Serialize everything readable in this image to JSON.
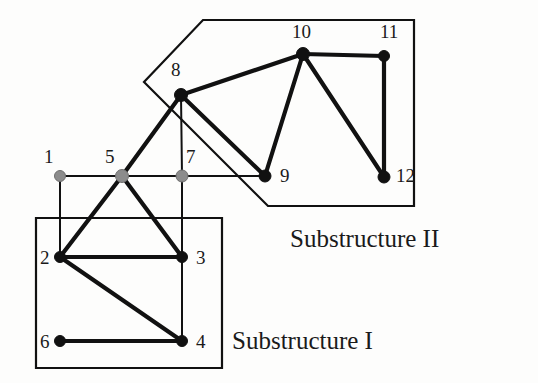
{
  "figure": {
    "background_color": "#fdfdfc",
    "ink_color": "#111111",
    "gray_node_color": "#8c8c8c",
    "black_node_color": "#111111"
  },
  "chart_data": {
    "type": "diagram",
    "subtype": "node-link-graph",
    "coordinate_space": {
      "width": 538,
      "height": 383,
      "origin": "top-left"
    },
    "nodes": [
      {
        "id": "1",
        "label": "1",
        "x": 60,
        "y": 176,
        "fill": "gray",
        "radius": 5.5,
        "label_x": 44,
        "label_y": 147
      },
      {
        "id": "2",
        "label": "2",
        "x": 60,
        "y": 257,
        "fill": "black",
        "radius": 5.5,
        "label_x": 40,
        "label_y": 248
      },
      {
        "id": "3",
        "label": "3",
        "x": 182,
        "y": 257,
        "fill": "black",
        "radius": 5.5,
        "label_x": 196,
        "label_y": 248
      },
      {
        "id": "4",
        "label": "4",
        "x": 182,
        "y": 341,
        "fill": "black",
        "radius": 5.5,
        "label_x": 196,
        "label_y": 332
      },
      {
        "id": "5",
        "label": "5",
        "x": 122,
        "y": 176,
        "fill": "gray",
        "radius": 6.5,
        "label_x": 105,
        "label_y": 147
      },
      {
        "id": "6",
        "label": "6",
        "x": 60,
        "y": 341,
        "fill": "black",
        "radius": 5.5,
        "label_x": 40,
        "label_y": 332
      },
      {
        "id": "7",
        "label": "7",
        "x": 182,
        "y": 176,
        "fill": "gray",
        "radius": 6.0,
        "label_x": 186,
        "label_y": 147
      },
      {
        "id": "8",
        "label": "8",
        "x": 181,
        "y": 95,
        "fill": "black",
        "radius": 6.5,
        "label_x": 171,
        "label_y": 60
      },
      {
        "id": "9",
        "label": "9",
        "x": 265,
        "y": 176,
        "fill": "black",
        "radius": 6.0,
        "label_x": 280,
        "label_y": 166
      },
      {
        "id": "10",
        "label": "10",
        "x": 303,
        "y": 54,
        "fill": "black",
        "radius": 6.5,
        "label_x": 292,
        "label_y": 22
      },
      {
        "id": "11",
        "label": "11",
        "x": 384,
        "y": 56,
        "fill": "black",
        "radius": 5.5,
        "label_x": 380,
        "label_y": 22
      },
      {
        "id": "12",
        "label": "12",
        "x": 384,
        "y": 177,
        "fill": "black",
        "radius": 6.0,
        "label_x": 396,
        "label_y": 166
      }
    ],
    "edges": [
      {
        "source": "1",
        "target": "5",
        "weight": "thin"
      },
      {
        "source": "1",
        "target": "2",
        "weight": "thin"
      },
      {
        "source": "5",
        "target": "7",
        "weight": "thin"
      },
      {
        "source": "7",
        "target": "9",
        "weight": "thin"
      },
      {
        "source": "7",
        "target": "3",
        "weight": "thin"
      },
      {
        "source": "5",
        "target": "2",
        "weight": "thick"
      },
      {
        "source": "5",
        "target": "3",
        "weight": "thick"
      },
      {
        "source": "5",
        "target": "8",
        "weight": "thick"
      },
      {
        "source": "2",
        "target": "3",
        "weight": "thick"
      },
      {
        "source": "2",
        "target": "4",
        "weight": "thick"
      },
      {
        "source": "3",
        "target": "4",
        "weight": "thin"
      },
      {
        "source": "6",
        "target": "4",
        "weight": "thick"
      },
      {
        "source": "8",
        "target": "7",
        "weight": "thin"
      },
      {
        "source": "8",
        "target": "9",
        "weight": "thick"
      },
      {
        "source": "8",
        "target": "10",
        "weight": "thick"
      },
      {
        "source": "10",
        "target": "9",
        "weight": "thick"
      },
      {
        "source": "10",
        "target": "11",
        "weight": "thick"
      },
      {
        "source": "10",
        "target": "12",
        "weight": "thick"
      },
      {
        "source": "11",
        "target": "12",
        "weight": "thick"
      }
    ],
    "regions": [
      {
        "id": "substructure-1",
        "label": "Substructure I",
        "shape": "rect",
        "points": "36,218 222,218 222,368 36,368",
        "label_x": 232,
        "label_y": 328,
        "contains": [
          "2",
          "3",
          "4",
          "6"
        ]
      },
      {
        "id": "substructure-2",
        "label": "Substructure II",
        "shape": "polygon",
        "points": "203,20 414,20 414,206 268,206 144,82",
        "label_x": 290,
        "label_y": 226,
        "contains": [
          "8",
          "9",
          "10",
          "11",
          "12"
        ]
      }
    ]
  },
  "labels": {
    "substructure_1": "Substructure I",
    "substructure_2": "Substructure II"
  }
}
